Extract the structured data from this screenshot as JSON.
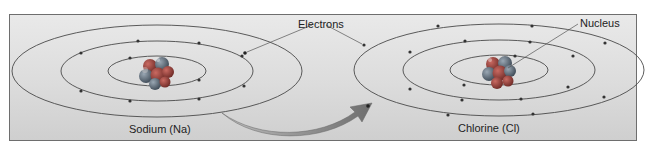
{
  "labels": {
    "electrons": "Electrons",
    "nucleus": "Nucleus",
    "sodium": "Sodium (Na)",
    "chlorine": "Chlorine (Cl)"
  },
  "atoms": [
    {
      "name": "Sodium (Na)",
      "shells": [
        2,
        8,
        1
      ]
    },
    {
      "name": "Chlorine (Cl)",
      "shells": [
        2,
        8,
        7
      ]
    }
  ],
  "colors": {
    "background": "#dcdcdc",
    "orbit": "#4a4a4a",
    "electron": "#333333",
    "nucleus_a": "#8a3b36",
    "nucleus_b": "#5b6a78",
    "arrow": "#7d7d7d"
  },
  "annotation": "Electron transfers from Sodium to Chlorine"
}
